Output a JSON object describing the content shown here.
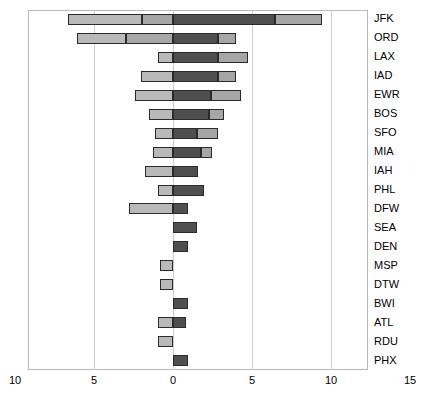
{
  "chart_data": {
    "type": "bar",
    "orientation": "horizontal",
    "subtype": "diverging-stacked",
    "title": "",
    "xlabel": "",
    "ylabel": "",
    "xlim": [
      -10,
      15
    ],
    "grid": true,
    "grid_axis": "x",
    "legend": "none",
    "xticks": [
      -10,
      -5,
      0,
      5,
      10,
      15
    ],
    "xtick_labels": [
      "10",
      "5",
      "0",
      "5",
      "10",
      "15"
    ],
    "categories": [
      "JFK",
      "ORD",
      "LAX",
      "IAD",
      "EWR",
      "BOS",
      "SFO",
      "MIA",
      "IAH",
      "PHL",
      "DFW",
      "SEA",
      "DEN",
      "MSP",
      "DTW",
      "BWI",
      "ATL",
      "RDU",
      "PHX"
    ],
    "series": [
      {
        "name": "lower",
        "color": "#b9b9b9",
        "values": [
          -4.7,
          -3.1,
          -0.95,
          -2.0,
          -2.4,
          -1.55,
          -1.15,
          -1.25,
          -1.8,
          0.0,
          -2.8,
          0.0,
          0.0,
          -0.8,
          -0.85,
          0.0,
          -0.95,
          -0.95,
          0.0
        ]
      },
      {
        "name": "inner-low",
        "color": "#a6a6a6",
        "values": [
          -1.95,
          -2.95,
          0.0,
          0.0,
          0.0,
          0.0,
          0.0,
          0.0,
          0.0,
          -0.95,
          0.0,
          0.0,
          0.0,
          0.0,
          0.0,
          0.0,
          0.0,
          0.0,
          0.0
        ]
      },
      {
        "name": "inner-high",
        "color": "#4f4f4f",
        "values": [
          6.45,
          2.85,
          2.85,
          2.85,
          2.4,
          2.3,
          1.55,
          1.75,
          1.6,
          1.95,
          0.95,
          1.55,
          0.95,
          0.0,
          0.0,
          0.95,
          0.8,
          0.0,
          0.95
        ]
      },
      {
        "name": "upper",
        "color": "#a6a6a6",
        "values": [
          3.0,
          1.15,
          1.9,
          1.15,
          1.9,
          0.95,
          0.0,
          0.0,
          0.0,
          0.0,
          0.0,
          0.0,
          0.0,
          0.0,
          0.0,
          0.0,
          0.0,
          0.0,
          0.0
        ]
      }
    ],
    "bar_extents": [
      {
        "category": "JFK",
        "low": -6.65,
        "q1": -1.95,
        "q3": 6.45,
        "high": 9.45
      },
      {
        "category": "ORD",
        "low": -6.05,
        "q1": -2.95,
        "q3": 2.85,
        "high": 4.0
      },
      {
        "category": "LAX",
        "low": -0.95,
        "q1": 0.0,
        "q3": 2.85,
        "high": 4.75
      },
      {
        "category": "IAD",
        "low": -2.0,
        "q1": 0.0,
        "q3": 2.85,
        "high": 4.0
      },
      {
        "category": "EWR",
        "low": -2.4,
        "q1": 0.0,
        "q3": 2.4,
        "high": 4.3
      },
      {
        "category": "BOS",
        "low": -1.55,
        "q1": 0.0,
        "q3": 2.3,
        "high": 3.25
      },
      {
        "category": "SFO",
        "low": -1.15,
        "q1": 0.0,
        "q3": 1.55,
        "high": 2.85
      },
      {
        "category": "MIA",
        "low": -1.25,
        "q1": 0.0,
        "q3": 1.75,
        "high": 2.5
      },
      {
        "category": "IAH",
        "low": -1.8,
        "q1": 0.0,
        "q3": 1.6,
        "high": 1.6
      },
      {
        "category": "PHL",
        "low": -0.95,
        "q1": 0.0,
        "q3": 1.95,
        "high": 1.95
      },
      {
        "category": "DFW",
        "low": -2.8,
        "q1": 0.0,
        "q3": 0.95,
        "high": 0.95
      },
      {
        "category": "SEA",
        "low": 0.0,
        "q1": 0.0,
        "q3": 1.55,
        "high": 1.55
      },
      {
        "category": "DEN",
        "low": 0.0,
        "q1": 0.0,
        "q3": 0.95,
        "high": 0.95
      },
      {
        "category": "MSP",
        "low": -0.8,
        "q1": 0.0,
        "q3": 0.0,
        "high": 0.0
      },
      {
        "category": "DTW",
        "low": -0.85,
        "q1": 0.0,
        "q3": 0.0,
        "high": 0.0
      },
      {
        "category": "BWI",
        "low": 0.0,
        "q1": 0.0,
        "q3": 0.95,
        "high": 0.95
      },
      {
        "category": "ATL",
        "low": -0.95,
        "q1": 0.0,
        "q3": 0.8,
        "high": 0.8
      },
      {
        "category": "RDU",
        "low": -0.95,
        "q1": 0.0,
        "q3": 0.0,
        "high": 0.0
      },
      {
        "category": "PHX",
        "low": 0.0,
        "q1": 0.0,
        "q3": 0.95,
        "high": 0.95
      }
    ],
    "colors": {
      "light": "#b9b9b9",
      "medium": "#a6a6a6",
      "dark": "#4f4f4f",
      "darkest": "#262626",
      "outline": "#2b2b2b",
      "grid": "#cccccc",
      "frame": "#b9b9b9",
      "text": "#000000",
      "background": "#ffffff"
    }
  }
}
